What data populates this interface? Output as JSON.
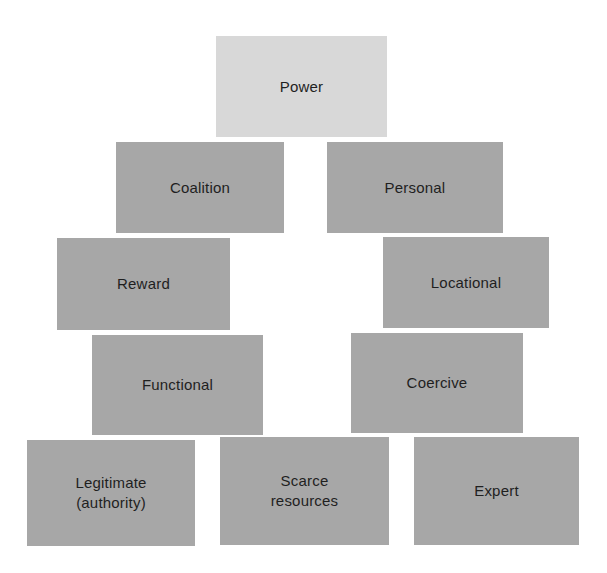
{
  "diagram": {
    "type": "hierarchy",
    "colors": {
      "root_fill": "#d8d8d8",
      "node_fill": "#a7a7a7",
      "text": "#1f1f1f",
      "background": "#ffffff"
    },
    "root": {
      "label": "Power"
    },
    "nodes": [
      {
        "id": "coalition",
        "label": "Coalition"
      },
      {
        "id": "personal",
        "label": "Personal"
      },
      {
        "id": "reward",
        "label": "Reward"
      },
      {
        "id": "locational",
        "label": "Locational"
      },
      {
        "id": "functional",
        "label": "Functional"
      },
      {
        "id": "coercive",
        "label": "Coercive"
      },
      {
        "id": "legitimate",
        "label": "Legitimate\n(authority)"
      },
      {
        "id": "scarce",
        "label": "Scarce\nresources"
      },
      {
        "id": "expert",
        "label": "Expert"
      }
    ]
  }
}
